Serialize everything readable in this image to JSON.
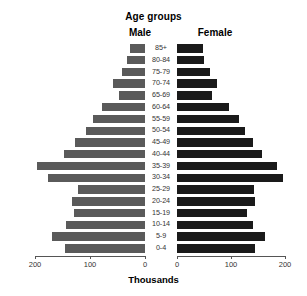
{
  "chart_data": {
    "type": "bar",
    "subtype": "population-pyramid",
    "title": "Age groups",
    "xlabel": "Thousands",
    "ylabel": "",
    "grid": false,
    "legend_position": "top",
    "left_axis": {
      "label": "Male",
      "ticks": [
        200,
        100,
        0
      ],
      "tick_labels": [
        "200",
        "100",
        "0"
      ],
      "range": [
        200,
        0
      ],
      "direction": "reversed"
    },
    "right_axis": {
      "label": "Female",
      "ticks": [
        0,
        100,
        200
      ],
      "tick_labels": [
        "0",
        "100",
        "200"
      ],
      "range": [
        0,
        200
      ],
      "direction": "normal"
    },
    "categories": [
      "85+",
      "80-84",
      "75-79",
      "70-74",
      "65-69",
      "60-64",
      "55-59",
      "50-54",
      "45-49",
      "40-44",
      "35-39",
      "30-34",
      "25-29",
      "20-24",
      "15-19",
      "10-14",
      "5-9",
      "0-4"
    ],
    "series": [
      {
        "name": "Male",
        "color": "#5a5a5a",
        "units": "thousands",
        "values": [
          27,
          33,
          42,
          58,
          48,
          79,
          95,
          108,
          128,
          148,
          196,
          176,
          122,
          133,
          130,
          143,
          170,
          145
        ]
      },
      {
        "name": "Female",
        "color": "#1a1a1a",
        "units": "thousands",
        "values": [
          48,
          50,
          61,
          74,
          64,
          97,
          114,
          125,
          140,
          157,
          186,
          196,
          142,
          145,
          130,
          140,
          163,
          144
        ]
      }
    ]
  },
  "colors": {
    "male_bar": "#5a5a5a",
    "female_bar": "#1a1a1a",
    "axis": "#555555",
    "text": "#000000",
    "background": "#ffffff"
  }
}
